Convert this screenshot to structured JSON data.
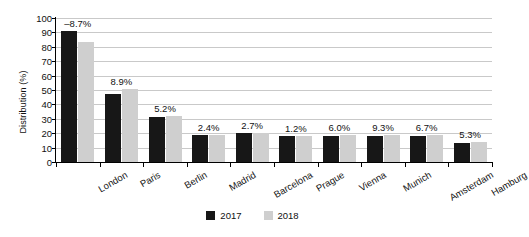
{
  "chart_data": {
    "type": "bar",
    "title": "",
    "xlabel": "",
    "ylabel": "Distribution (%)",
    "ylim": [
      0,
      100
    ],
    "ytick_step": 10,
    "yticks": [
      0,
      10,
      20,
      30,
      40,
      50,
      60,
      70,
      80,
      90,
      100
    ],
    "grid": true,
    "legend_position": "bottom",
    "categories": [
      "London",
      "Paris",
      "Berlin",
      "Madrid",
      "Barcelona",
      "Prague",
      "Vienna",
      "Munich",
      "Amsterdam",
      "Hamburg"
    ],
    "series": [
      {
        "name": "2017",
        "color": "#171717",
        "values": [
          91,
          47,
          31,
          19,
          20,
          18,
          18,
          18,
          18,
          13
        ]
      },
      {
        "name": "2018",
        "color": "#cfcfcf",
        "values": [
          83,
          51,
          32,
          19,
          20,
          18,
          19,
          19,
          19,
          14
        ]
      }
    ],
    "annotations": [
      "–8.7%",
      "8.9%",
      "5.2%",
      "2.4%",
      "2.7%",
      "1.2%",
      "6.0%",
      "9.3%",
      "6.7%",
      "5.3%"
    ]
  },
  "legend": {
    "items": [
      {
        "label": "2017"
      },
      {
        "label": "2018"
      }
    ]
  }
}
